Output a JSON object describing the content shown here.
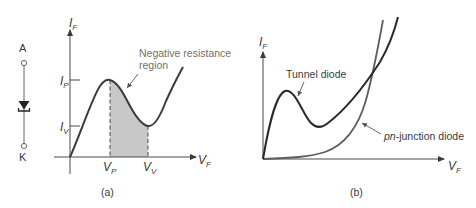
{
  "figure_a": {
    "caption": "(a)",
    "symbol": {
      "anode_label": "A",
      "cathode_label": "K"
    },
    "y_axis_label": "I",
    "y_axis_sub": "F",
    "x_axis_label": "V",
    "x_axis_sub": "F",
    "ticks_y": [
      {
        "label": "I",
        "sub": "P"
      },
      {
        "label": "I",
        "sub": "V"
      }
    ],
    "ticks_x": [
      {
        "label": "V",
        "sub": "P"
      },
      {
        "label": "V",
        "sub": "V"
      }
    ],
    "annotation_line1": "Negative resistance",
    "annotation_line2": "region"
  },
  "figure_b": {
    "caption": "(b)",
    "y_axis_label": "I",
    "y_axis_sub": "F",
    "x_axis_label": "V",
    "x_axis_sub": "F",
    "tunnel_label": "Tunnel diode",
    "pn_label_italic": "pn",
    "pn_label_rest": "-junction diode"
  },
  "colors": {
    "curve": "#3a3a3a",
    "axis": "#4a4a4a",
    "shade": "#c8c8c8",
    "label_gray": "#707070"
  }
}
